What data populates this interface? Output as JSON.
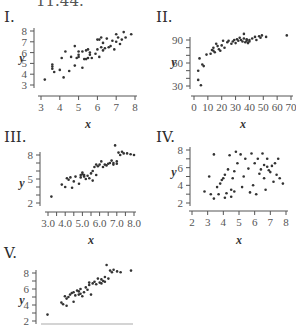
{
  "figure_number": "11.44.",
  "panels": [
    {
      "label": "I.",
      "xlabel": "x",
      "ylabel": "y"
    },
    {
      "label": "II.",
      "xlabel": "x",
      "ylabel": "y"
    },
    {
      "label": "III.",
      "xlabel": "x",
      "ylabel": "y"
    },
    {
      "label": "IV.",
      "xlabel": "x",
      "ylabel": "y"
    },
    {
      "label": "V.",
      "xlabel": "",
      "ylabel": "y"
    }
  ],
  "chart_data": [
    {
      "type": "scatter",
      "title": "I.",
      "xlabel": "x",
      "ylabel": "y",
      "xlim": [
        3,
        8
      ],
      "ylim": [
        3,
        8
      ],
      "xticks": [
        "3",
        "4",
        "5",
        "6",
        "7",
        "8"
      ],
      "yticks": [
        "3",
        "4",
        "5",
        "6",
        "7",
        "8"
      ],
      "grid": false,
      "x": [
        3.2,
        3.6,
        3.6,
        3.6,
        3.7,
        4.0,
        4.1,
        4.2,
        4.3,
        4.5,
        4.6,
        4.8,
        4.8,
        4.9,
        5.0,
        5.0,
        5.0,
        5.2,
        5.2,
        5.3,
        5.4,
        5.4,
        5.5,
        5.5,
        5.6,
        5.6,
        5.7,
        5.9,
        6.0,
        6.0,
        6.1,
        6.1,
        6.2,
        6.2,
        6.3,
        6.3,
        6.4,
        6.5,
        6.6,
        6.7,
        6.8,
        6.9,
        7.0,
        7.0,
        7.1,
        7.2,
        7.3,
        7.4,
        7.5,
        7.8
      ],
      "y": [
        3.5,
        4.5,
        4.7,
        4.9,
        4.2,
        4.4,
        5.5,
        3.7,
        6.1,
        4.3,
        5.6,
        4.8,
        6.6,
        5.5,
        6.1,
        5.8,
        5.6,
        4.6,
        6.1,
        5.4,
        5.4,
        6.2,
        5.5,
        6.3,
        5.8,
        6.0,
        5.5,
        5.9,
        7.2,
        6.3,
        7.2,
        5.6,
        7.4,
        6.5,
        6.2,
        6.9,
        6.4,
        7.3,
        6.5,
        6.6,
        7.1,
        6.3,
        7.7,
        7.0,
        7.4,
        6.8,
        7.2,
        7.9,
        7.4,
        7.7
      ]
    },
    {
      "type": "scatter",
      "title": "II.",
      "xlabel": "x",
      "ylabel": "y",
      "xlim": [
        0,
        70
      ],
      "ylim": [
        30,
        90
      ],
      "xticks": [
        "0",
        "10",
        "20",
        "30",
        "40",
        "50",
        "60",
        "70"
      ],
      "yticks": [
        "30",
        "60",
        "90"
      ],
      "grid": false,
      "x": [
        3,
        3,
        4,
        5,
        6,
        7,
        9,
        12,
        13,
        14,
        14,
        15,
        16,
        17,
        18,
        19,
        20,
        21,
        22,
        24,
        25,
        27,
        28,
        29,
        30,
        31,
        32,
        33,
        34,
        35,
        36,
        36,
        37,
        38,
        38,
        39,
        40,
        40,
        42,
        44,
        45,
        47,
        48,
        49,
        52,
        67
      ],
      "y": [
        38,
        50,
        66,
        31,
        58,
        56,
        71,
        72,
        77,
        80,
        76,
        74,
        85,
        82,
        78,
        76,
        83,
        89,
        80,
        87,
        89,
        85,
        88,
        90,
        86,
        91,
        89,
        93,
        90,
        88,
        92,
        98,
        87,
        91,
        89,
        86,
        90,
        88,
        92,
        94,
        90,
        95,
        93,
        96,
        94,
        96
      ]
    },
    {
      "type": "scatter",
      "title": "III.",
      "xlabel": "x",
      "ylabel": "y",
      "xlim": [
        3.0,
        8.0
      ],
      "ylim": [
        2,
        8
      ],
      "xticks": [
        "3.0",
        "4.0",
        "5.0",
        "6.0",
        "7.0",
        "8.0"
      ],
      "yticks": [
        "2",
        "5",
        "8"
      ],
      "grid": false,
      "x": [
        3.2,
        3.8,
        4.0,
        4.1,
        4.2,
        4.3,
        4.4,
        4.5,
        4.6,
        4.8,
        4.9,
        4.9,
        5.0,
        5.0,
        5.1,
        5.1,
        5.2,
        5.3,
        5.4,
        5.5,
        5.6,
        5.6,
        5.7,
        5.8,
        5.8,
        5.9,
        6.0,
        6.1,
        6.2,
        6.3,
        6.4,
        6.5,
        6.6,
        6.7,
        6.8,
        6.8,
        6.9,
        7.0,
        7.0,
        7.1,
        7.2,
        7.3,
        7.4,
        7.6,
        7.8,
        8.0
      ],
      "y": [
        2.8,
        4.3,
        4.0,
        5.1,
        4.9,
        5.2,
        3.9,
        4.7,
        5.3,
        4.4,
        5.2,
        5.5,
        5.8,
        5.6,
        5.3,
        5.5,
        5.0,
        5.4,
        5.1,
        5.7,
        6.0,
        4.8,
        6.5,
        6.8,
        5.5,
        6.6,
        6.8,
        7.2,
        6.5,
        6.8,
        6.7,
        6.9,
        7.0,
        7.3,
        6.8,
        7.0,
        9.2,
        7.2,
        6.9,
        8.3,
        8.0,
        8.4,
        8.2,
        8.2,
        8.1,
        8.0
      ]
    },
    {
      "type": "scatter",
      "title": "IV.",
      "xlabel": "x",
      "ylabel": "y",
      "xlim": [
        2,
        8
      ],
      "ylim": [
        2,
        8
      ],
      "xticks": [
        "2",
        "3",
        "4",
        "5",
        "6",
        "7",
        "8"
      ],
      "yticks": [
        "2",
        "4",
        "6",
        "8"
      ],
      "grid": false,
      "x": [
        2.8,
        3.1,
        3.2,
        3.4,
        3.4,
        3.6,
        3.7,
        3.8,
        3.9,
        4.0,
        4.1,
        4.1,
        4.2,
        4.3,
        4.4,
        4.5,
        4.5,
        4.6,
        4.7,
        4.7,
        4.8,
        4.9,
        5.1,
        5.2,
        5.3,
        5.4,
        5.6,
        5.7,
        5.8,
        5.9,
        6.0,
        6.1,
        6.2,
        6.3,
        6.4,
        6.5,
        6.6,
        6.6,
        6.7,
        6.8,
        6.8,
        6.9,
        7.0,
        7.1,
        7.2,
        7.3,
        7.4,
        7.5,
        7.6,
        7.8
      ],
      "y": [
        3.3,
        5.0,
        3.0,
        2.5,
        7.5,
        3.8,
        3.0,
        4.2,
        4.6,
        4.8,
        2.6,
        5.2,
        3.1,
        5.8,
        7.4,
        3.5,
        2.7,
        4.8,
        3.3,
        5.6,
        7.8,
        6.5,
        7.5,
        3.8,
        5.0,
        7.0,
        5.9,
        3.2,
        7.6,
        4.0,
        6.5,
        3.0,
        7.0,
        5.3,
        5.8,
        7.6,
        4.8,
        6.3,
        3.5,
        6.1,
        7.0,
        5.7,
        5.5,
        6.2,
        4.4,
        6.5,
        5.2,
        7.0,
        4.8,
        4.2
      ]
    },
    {
      "type": "scatter",
      "title": "V.",
      "xlabel": "",
      "ylabel": "y",
      "xlim": [
        3.0,
        8.0
      ],
      "ylim": [
        2,
        8
      ],
      "xticks": [],
      "yticks": [
        "2",
        "4",
        "6",
        "8"
      ],
      "grid": false,
      "x": [
        3.2,
        4.0,
        4.1,
        4.2,
        4.3,
        4.3,
        4.4,
        4.5,
        4.6,
        4.7,
        4.7,
        4.8,
        4.9,
        5.0,
        5.0,
        5.1,
        5.1,
        5.2,
        5.3,
        5.4,
        5.5,
        5.6,
        5.6,
        5.7,
        5.8,
        5.9,
        6.0,
        6.1,
        6.2,
        6.3,
        6.3,
        6.4,
        6.5,
        6.5,
        6.6,
        6.7,
        6.8,
        6.9,
        7.0,
        7.2,
        7.4,
        8.0
      ],
      "y": [
        2.8,
        4.3,
        4.1,
        5.1,
        4.8,
        3.9,
        5.0,
        5.3,
        5.5,
        4.4,
        5.6,
        5.2,
        5.8,
        5.3,
        5.7,
        5.4,
        6.0,
        5.1,
        5.6,
        6.2,
        5.9,
        6.5,
        6.8,
        5.3,
        6.7,
        6.9,
        6.6,
        7.3,
        6.8,
        6.7,
        7.2,
        7.0,
        6.9,
        7.5,
        9.0,
        7.3,
        8.3,
        8.1,
        8.4,
        8.2,
        8.1,
        8.3
      ]
    }
  ]
}
